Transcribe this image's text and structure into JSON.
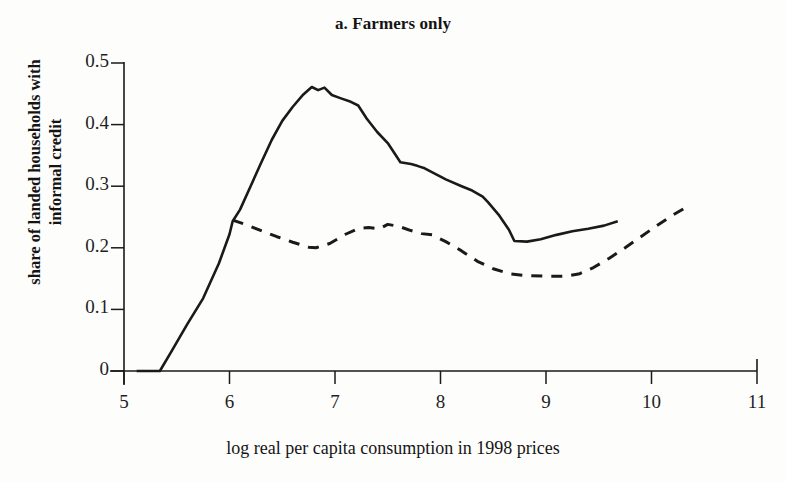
{
  "figure": {
    "title": "a. Farmers only",
    "background_color": "#fdfdfc",
    "ink_color": "#1a1a1a"
  },
  "axes": {
    "y_title_line1": "share of landed households with",
    "y_title_line2": "informal credit",
    "x_title": "log real per capita consumption in 1998 prices",
    "y_ticks": [
      "0",
      "0.1",
      "0.2",
      "0.3",
      "0.4",
      "0.5"
    ],
    "x_ticks": [
      "5",
      "6",
      "7",
      "8",
      "9",
      "10",
      "11"
    ]
  },
  "chart_data": {
    "type": "line",
    "title": "a. Farmers only",
    "xlabel": "log real per capita consumption in 1998 prices",
    "ylabel": "share of landed households with informal credit",
    "xlim": [
      5,
      11
    ],
    "ylim": [
      0,
      0.5
    ],
    "xticks": [
      5,
      6,
      7,
      8,
      9,
      10,
      11
    ],
    "yticks": [
      0,
      0.1,
      0.2,
      0.3,
      0.4,
      0.5
    ],
    "grid": false,
    "legend": "none",
    "series": [
      {
        "name": "solid",
        "style": "solid",
        "color": "#1a1a1a",
        "points": [
          [
            5.12,
            0.0
          ],
          [
            5.2,
            0.0
          ],
          [
            5.34,
            0.0
          ],
          [
            5.45,
            0.032
          ],
          [
            5.6,
            0.076
          ],
          [
            5.75,
            0.118
          ],
          [
            5.9,
            0.175
          ],
          [
            6.0,
            0.222
          ],
          [
            6.03,
            0.243
          ],
          [
            6.1,
            0.262
          ],
          [
            6.2,
            0.3
          ],
          [
            6.3,
            0.338
          ],
          [
            6.4,
            0.375
          ],
          [
            6.5,
            0.406
          ],
          [
            6.6,
            0.429
          ],
          [
            6.7,
            0.449
          ],
          [
            6.78,
            0.461
          ],
          [
            6.84,
            0.456
          ],
          [
            6.9,
            0.46
          ],
          [
            6.97,
            0.448
          ],
          [
            7.05,
            0.443
          ],
          [
            7.15,
            0.437
          ],
          [
            7.22,
            0.431
          ],
          [
            7.3,
            0.41
          ],
          [
            7.4,
            0.388
          ],
          [
            7.5,
            0.37
          ],
          [
            7.57,
            0.352
          ],
          [
            7.62,
            0.339
          ],
          [
            7.72,
            0.336
          ],
          [
            7.78,
            0.333
          ],
          [
            7.85,
            0.329
          ],
          [
            7.95,
            0.32
          ],
          [
            8.05,
            0.311
          ],
          [
            8.2,
            0.3
          ],
          [
            8.3,
            0.293
          ],
          [
            8.4,
            0.283
          ],
          [
            8.45,
            0.274
          ],
          [
            8.55,
            0.254
          ],
          [
            8.65,
            0.229
          ],
          [
            8.7,
            0.211
          ],
          [
            8.82,
            0.21
          ],
          [
            8.95,
            0.214
          ],
          [
            9.1,
            0.221
          ],
          [
            9.25,
            0.227
          ],
          [
            9.4,
            0.231
          ],
          [
            9.55,
            0.236
          ],
          [
            9.68,
            0.243
          ]
        ]
      },
      {
        "name": "dashed",
        "style": "dashed",
        "color": "#1a1a1a",
        "points": [
          [
            6.03,
            0.245
          ],
          [
            6.15,
            0.238
          ],
          [
            6.3,
            0.228
          ],
          [
            6.45,
            0.218
          ],
          [
            6.6,
            0.209
          ],
          [
            6.75,
            0.201
          ],
          [
            6.82,
            0.2
          ],
          [
            6.95,
            0.207
          ],
          [
            7.1,
            0.222
          ],
          [
            7.22,
            0.231
          ],
          [
            7.32,
            0.233
          ],
          [
            7.42,
            0.231
          ],
          [
            7.5,
            0.238
          ],
          [
            7.6,
            0.235
          ],
          [
            7.72,
            0.228
          ],
          [
            7.82,
            0.223
          ],
          [
            7.92,
            0.221
          ],
          [
            8.05,
            0.21
          ],
          [
            8.2,
            0.195
          ],
          [
            8.35,
            0.178
          ],
          [
            8.5,
            0.166
          ],
          [
            8.65,
            0.158
          ],
          [
            8.8,
            0.155
          ],
          [
            9.0,
            0.154
          ],
          [
            9.2,
            0.154
          ],
          [
            9.32,
            0.158
          ],
          [
            9.45,
            0.168
          ],
          [
            9.6,
            0.183
          ],
          [
            9.75,
            0.2
          ],
          [
            9.9,
            0.218
          ],
          [
            10.05,
            0.236
          ],
          [
            10.2,
            0.253
          ],
          [
            10.35,
            0.268
          ]
        ]
      }
    ]
  }
}
